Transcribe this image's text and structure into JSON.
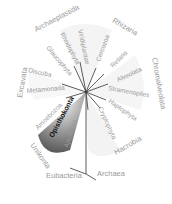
{
  "colors": {
    "background": "#ffffff",
    "label": "#9a9a9a",
    "label_dark": "#111111",
    "branch": "#333333",
    "highlight_fan": "#6e6e6e"
  },
  "supergroups": [
    {
      "label": "Archaeplastida"
    },
    {
      "label": "Rhizaria"
    },
    {
      "label": "Chromalveolata"
    },
    {
      "label": "Excavata"
    },
    {
      "label": "Unikonta"
    }
  ],
  "groups": [
    {
      "label": "Glaucophyta"
    },
    {
      "label": "Rhodophyta"
    },
    {
      "label": "Viridiplantae"
    },
    {
      "label": "Cercozoa"
    },
    {
      "label": "Retaria"
    },
    {
      "label": "Alveolata"
    },
    {
      "label": "Stramenopiles"
    },
    {
      "label": "Haptophyta"
    },
    {
      "label": "Cryptophyta"
    },
    {
      "label": "Discoba"
    },
    {
      "label": "Metamonada"
    },
    {
      "label": "Amoebozoa"
    },
    {
      "label": "Opisthokonta"
    },
    {
      "label": "Apusozoa"
    }
  ],
  "extra_groups": [
    {
      "label": "Hacrobia"
    }
  ],
  "outgroups": [
    {
      "label": "Eubacteria"
    },
    {
      "label": "Archaea"
    }
  ]
}
